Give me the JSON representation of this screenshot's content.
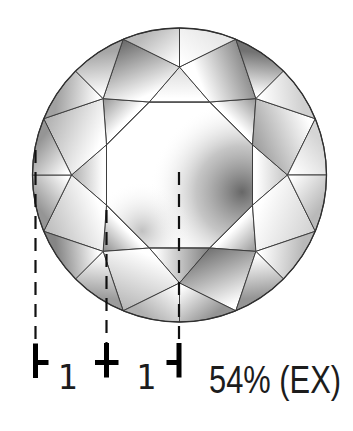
{
  "figure": {
    "annotation_style": "table-size-ratio-estimate",
    "measure": {
      "left_ratio": "1",
      "right_ratio": "1",
      "table_size": "54% (EX)"
    },
    "ticks": [
      "left-end-tick",
      "center-cross-tick",
      "right-end-tick"
    ],
    "colors": {
      "background": "#ffffff",
      "facet_line": "#3e3e3e",
      "girdle_line": "#2f2f2f",
      "dash_line": "#111111",
      "tick": "#000000",
      "text": "#1c1c1c"
    }
  }
}
